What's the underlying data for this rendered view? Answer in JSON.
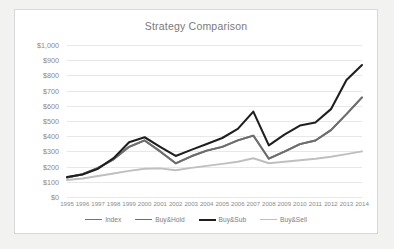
{
  "chart_data": {
    "type": "line",
    "title": "Strategy Comparison",
    "xlabel": "",
    "ylabel": "",
    "grid": true,
    "legend_position": "bottom",
    "ylim": [
      0,
      1000
    ],
    "ytick_step": 100,
    "ytick_labels": [
      "$1,000",
      "$900",
      "$800",
      "$700",
      "$600",
      "$500",
      "$400",
      "$300",
      "$200",
      "$100",
      "$0"
    ],
    "ytick_values": [
      1000,
      900,
      800,
      700,
      600,
      500,
      400,
      300,
      200,
      100,
      0
    ],
    "categories": [
      "1995",
      "1996",
      "1997",
      "1998",
      "1999",
      "2000",
      "2001",
      "2002",
      "2003",
      "2004",
      "2005",
      "2006",
      "2007",
      "2008",
      "2009",
      "2010",
      "2011",
      "2012",
      "2013",
      "2014"
    ],
    "series": [
      {
        "name": "Index",
        "color": "#737373",
        "width": 1.9,
        "values": [
          128,
          150,
          192,
          248,
          330,
          372,
          300,
          222,
          268,
          305,
          330,
          372,
          404,
          252,
          298,
          348,
          372,
          440,
          545,
          655
        ]
      },
      {
        "name": "Buy&Hold",
        "color": "#6e6e6e",
        "width": 1.9,
        "values": [
          128,
          150,
          192,
          248,
          330,
          372,
          300,
          222,
          268,
          305,
          330,
          372,
          404,
          252,
          298,
          348,
          372,
          440,
          545,
          655
        ]
      },
      {
        "name": "Buy&Sub",
        "color": "#1f1f1f",
        "width": 2.1,
        "values": [
          132,
          148,
          186,
          255,
          360,
          393,
          330,
          270,
          310,
          348,
          388,
          448,
          562,
          340,
          410,
          470,
          490,
          578,
          770,
          868
        ]
      },
      {
        "name": "Buy&Sell",
        "color": "#bfbfbf",
        "width": 1.9,
        "values": [
          112,
          122,
          138,
          155,
          172,
          186,
          188,
          176,
          192,
          205,
          218,
          232,
          255,
          222,
          232,
          242,
          252,
          265,
          282,
          300
        ]
      }
    ]
  },
  "legend": {
    "items": [
      {
        "label": "Index",
        "color": "#737373"
      },
      {
        "label": "Buy&Hold",
        "color": "#6e6e6e"
      },
      {
        "label": "Buy&Sub",
        "color": "#1f1f1f"
      },
      {
        "label": "Buy&Sell",
        "color": "#bfbfbf"
      }
    ]
  }
}
